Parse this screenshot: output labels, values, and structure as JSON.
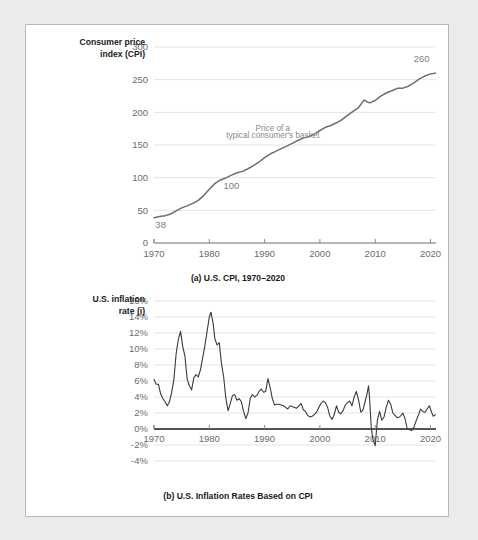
{
  "figure": {
    "background": "#ebebeb",
    "card_background": "#ffffff",
    "border_color": "#b9b9b9"
  },
  "chart_data": [
    {
      "id": "cpi",
      "type": "line",
      "title": "",
      "caption": "(a) U.S. CPI, 1970–2020",
      "ylabel_line1": "Consumer price",
      "ylabel_line2": "index (CPI)",
      "xlabel": "",
      "xlim": [
        1970,
        2021
      ],
      "ylim": [
        0,
        300
      ],
      "yticks": [
        0,
        50,
        100,
        150,
        200,
        250,
        300
      ],
      "ytick_labels": [
        "0",
        "50",
        "100",
        "150",
        "200",
        "250",
        "300"
      ],
      "xticks": [
        1970,
        1980,
        1990,
        2000,
        2010,
        2020
      ],
      "xtick_labels": [
        "1970",
        "1980",
        "1990",
        "2000",
        "2010",
        "2020"
      ],
      "grid": true,
      "legend": "none",
      "series_color": "#6e6e6e",
      "annotations": [
        {
          "name": "basket-note-line1",
          "text": "Price of a",
          "x": 1991.5,
          "y": 172
        },
        {
          "name": "basket-note-line2",
          "text": "typical consumer's basket",
          "x": 1991.5,
          "y": 160
        }
      ],
      "point_labels": [
        {
          "name": "start-value",
          "text": "38",
          "x": 1971.2,
          "y": 23
        },
        {
          "name": "mid-value",
          "text": "100",
          "x": 1984.0,
          "y": 82
        },
        {
          "name": "end-value",
          "text": "260",
          "x": 2018.4,
          "y": 277
        }
      ],
      "x": [
        1970,
        1971,
        1972,
        1973,
        1974,
        1975,
        1976,
        1977,
        1978,
        1979,
        1980,
        1981,
        1982,
        1983,
        1984,
        1985,
        1986,
        1987,
        1988,
        1989,
        1990,
        1991,
        1992,
        1993,
        1994,
        1995,
        1996,
        1997,
        1998,
        1999,
        2000,
        2001,
        2002,
        2003,
        2004,
        2005,
        2006,
        2007,
        2008,
        2008.7,
        2009,
        2010,
        2011,
        2012,
        2013,
        2014,
        2015,
        2016,
        2017,
        2018,
        2019,
        2020,
        2020.9
      ],
      "values": [
        38.8,
        40.5,
        41.8,
        44.4,
        49.3,
        53.8,
        56.9,
        60.6,
        65.2,
        72.6,
        82.4,
        90.9,
        96.5,
        99.6,
        103.9,
        107.6,
        109.6,
        113.6,
        118.3,
        124.0,
        130.7,
        136.2,
        140.3,
        144.5,
        148.2,
        152.4,
        156.9,
        160.5,
        163.0,
        166.6,
        172.2,
        177.1,
        179.9,
        184.0,
        188.9,
        195.3,
        201.6,
        207.3,
        219.0,
        215.3,
        214.5,
        218.1,
        224.9,
        229.6,
        233.0,
        236.7,
        237.0,
        240.0,
        245.1,
        251.1,
        255.7,
        258.8,
        260.0
      ]
    },
    {
      "id": "inflation",
      "type": "line",
      "title": "",
      "caption": "(b) U.S. Inflation Rates Based on CPI",
      "ylabel_line1": "U.S. inflation",
      "ylabel_line2": "rate (i)",
      "xlabel": "",
      "xlim": [
        1970,
        2021
      ],
      "ylim": [
        -4,
        16
      ],
      "yticks": [
        -4,
        -2,
        0,
        2,
        4,
        6,
        8,
        10,
        12,
        14,
        16
      ],
      "ytick_labels": [
        "-4%",
        "-2%",
        "0%",
        "2%",
        "4%",
        "6%",
        "8%",
        "10%",
        "12%",
        "14%",
        "16%"
      ],
      "xticks": [
        1970,
        1980,
        1990,
        2000,
        2010,
        2020
      ],
      "xtick_labels": [
        "1970",
        "1980",
        "1990",
        "2000",
        "2010",
        "2020"
      ],
      "grid": true,
      "legend": "none",
      "series_color": "#3a3a3a",
      "annotations": [],
      "point_labels": [],
      "x": [
        1970.0,
        1970.4,
        1970.8,
        1971.2,
        1971.6,
        1972.0,
        1972.4,
        1972.8,
        1973.2,
        1973.6,
        1974.0,
        1974.4,
        1974.8,
        1975.2,
        1975.6,
        1976.0,
        1976.4,
        1976.8,
        1977.2,
        1977.6,
        1978.0,
        1978.4,
        1978.8,
        1979.2,
        1979.6,
        1980.0,
        1980.3,
        1980.7,
        1981.0,
        1981.4,
        1981.8,
        1982.2,
        1982.6,
        1983.0,
        1983.4,
        1983.8,
        1984.2,
        1984.6,
        1985.0,
        1985.4,
        1985.8,
        1986.2,
        1986.6,
        1987.0,
        1987.4,
        1987.8,
        1988.2,
        1988.6,
        1989.0,
        1989.4,
        1989.8,
        1990.2,
        1990.6,
        1991.0,
        1991.4,
        1991.8,
        1992.2,
        1992.6,
        1993.0,
        1993.4,
        1993.8,
        1994.2,
        1994.6,
        1995.0,
        1995.4,
        1995.8,
        1996.2,
        1996.6,
        1997.0,
        1997.4,
        1997.8,
        1998.2,
        1998.6,
        1999.0,
        1999.4,
        1999.8,
        2000.2,
        2000.6,
        2001.0,
        2001.4,
        2001.8,
        2002.2,
        2002.6,
        2003.0,
        2003.4,
        2003.8,
        2004.2,
        2004.6,
        2005.0,
        2005.4,
        2005.8,
        2006.2,
        2006.6,
        2007.0,
        2007.4,
        2007.8,
        2008.2,
        2008.5,
        2008.8,
        2009.0,
        2009.3,
        2009.6,
        2010.0,
        2010.4,
        2010.8,
        2011.2,
        2011.6,
        2012.0,
        2012.4,
        2012.8,
        2013.2,
        2013.6,
        2014.0,
        2014.4,
        2014.8,
        2015.0,
        2015.4,
        2015.8,
        2016.2,
        2016.6,
        2017.0,
        2017.4,
        2017.8,
        2018.2,
        2018.6,
        2019.0,
        2019.4,
        2019.8,
        2020.2,
        2020.5,
        2020.9
      ],
      "values": [
        6.2,
        5.6,
        5.6,
        4.4,
        3.8,
        3.4,
        2.9,
        3.4,
        4.6,
        6.2,
        9.4,
        11.2,
        12.2,
        10.3,
        9.1,
        6.2,
        5.4,
        4.9,
        6.4,
        6.8,
        6.5,
        7.4,
        8.9,
        10.4,
        12.2,
        14.0,
        14.6,
        13.2,
        11.3,
        10.5,
        10.8,
        8.2,
        6.5,
        3.8,
        2.3,
        3.2,
        4.2,
        4.3,
        3.6,
        3.8,
        3.4,
        2.2,
        1.3,
        2.0,
        3.8,
        4.3,
        4.0,
        4.2,
        4.7,
        5.0,
        4.6,
        4.7,
        6.3,
        5.2,
        3.8,
        3.0,
        3.1,
        3.1,
        3.0,
        2.9,
        2.7,
        2.5,
        2.9,
        2.8,
        2.7,
        2.6,
        2.9,
        3.2,
        2.4,
        2.2,
        1.7,
        1.5,
        1.6,
        1.8,
        2.1,
        2.7,
        3.2,
        3.5,
        3.3,
        2.7,
        1.6,
        1.2,
        1.8,
        2.9,
        2.1,
        1.9,
        2.3,
        3.0,
        3.3,
        3.5,
        2.9,
        4.0,
        4.7,
        3.6,
        2.1,
        2.4,
        3.5,
        4.3,
        5.4,
        3.7,
        0.1,
        -1.3,
        -2.1,
        1.1,
        2.2,
        1.1,
        1.5,
        2.7,
        3.6,
        3.1,
        2.0,
        1.7,
        1.4,
        1.5,
        1.8,
        2.0,
        1.3,
        0.0,
        -0.1,
        -0.2,
        0.2,
        1.0,
        1.7,
        2.5,
        2.2,
        2.1,
        2.5,
        2.9,
        2.1,
        1.6,
        1.8,
        2.3,
        1.5,
        0.3,
        1.2
      ]
    }
  ]
}
